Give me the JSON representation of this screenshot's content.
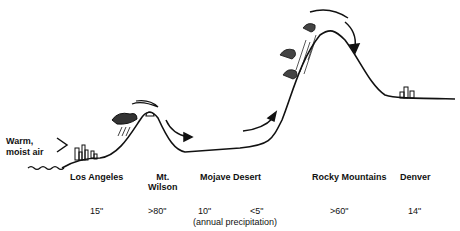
{
  "diagram": {
    "incoming_air": {
      "line1": "Warm,",
      "line2": "moist air"
    },
    "locations": [
      {
        "name": "Los Angeles",
        "precip": "15\""
      },
      {
        "name_line1": "Mt.",
        "name_line2": "Wilson",
        "precip": ">80\""
      },
      {
        "name": "Mojave Desert",
        "precip_a": "10\"",
        "precip_b": "<5\""
      },
      {
        "name": "Rocky Mountains",
        "precip": ">60\""
      },
      {
        "name": "Denver",
        "precip": "14\""
      }
    ],
    "precip_note": "(annual precipitation)",
    "colors": {
      "line": "#111111",
      "background": "#ffffff"
    }
  }
}
